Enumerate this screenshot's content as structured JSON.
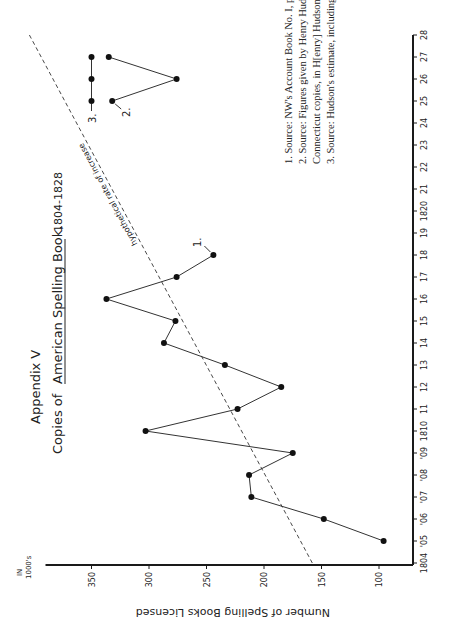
{
  "chart_data": {
    "type": "line",
    "title_line1": "Appendix V",
    "title_prefix": "Copies of",
    "title_book": "American Spelling Book,",
    "title_range": "1804-1828",
    "ylabel": "Number of Spelling Books Licensed",
    "yunits": [
      "IN",
      "1000's"
    ],
    "xlabel": "",
    "xlim": [
      1804,
      1828
    ],
    "ylim": [
      78,
      390
    ],
    "x_ticks": [
      {
        "value": 1804,
        "label": "1804"
      },
      {
        "value": 1805,
        "label": "'05"
      },
      {
        "value": 1806,
        "label": "'06"
      },
      {
        "value": 1807,
        "label": "'07"
      },
      {
        "value": 1808,
        "label": "'08"
      },
      {
        "value": 1809,
        "label": "'09"
      },
      {
        "value": 1810,
        "label": "1810"
      },
      {
        "value": 1811,
        "label": "11"
      },
      {
        "value": 1812,
        "label": "12"
      },
      {
        "value": 1813,
        "label": "13"
      },
      {
        "value": 1814,
        "label": "14"
      },
      {
        "value": 1815,
        "label": "15"
      },
      {
        "value": 1816,
        "label": "16"
      },
      {
        "value": 1817,
        "label": "17"
      },
      {
        "value": 1818,
        "label": "18"
      },
      {
        "value": 1819,
        "label": "19"
      },
      {
        "value": 1820,
        "label": "1820"
      },
      {
        "value": 1821,
        "label": "21"
      },
      {
        "value": 1822,
        "label": "22"
      },
      {
        "value": 1823,
        "label": "23"
      },
      {
        "value": 1824,
        "label": "24"
      },
      {
        "value": 1825,
        "label": "25"
      },
      {
        "value": 1826,
        "label": "26"
      },
      {
        "value": 1827,
        "label": "27"
      },
      {
        "value": 1828,
        "label": "28"
      }
    ],
    "y_ticks": [
      100,
      150,
      200,
      250,
      300,
      350
    ],
    "series": [
      {
        "name": "1.",
        "note": "NW's Account Book",
        "x": [
          1805,
          1806,
          1807,
          1808,
          1809,
          1810,
          1811,
          1812,
          1813,
          1814,
          1815,
          1816,
          1817,
          1818
        ],
        "values": [
          96,
          148,
          211,
          213,
          175,
          303,
          223,
          185,
          234,
          287,
          277,
          337,
          276,
          244
        ]
      },
      {
        "name": "2.",
        "note": "Henry Hudson figures",
        "x": [
          1825,
          1826,
          1827
        ],
        "values": [
          332,
          276,
          335
        ]
      },
      {
        "name": "3.",
        "note": "Hudson's estimate",
        "x": [
          1825,
          1826,
          1827
        ],
        "values": [
          350,
          350,
          350
        ]
      }
    ],
    "trend": {
      "label": "hypothetical rate of increase",
      "x": [
        1804,
        1828
      ],
      "values": [
        158,
        404
      ]
    },
    "footnotes": [
      "1.  Source: NW's Account Book No. I, pp. 63–68, NN–Account Books.",
      "2.  Source: Figures given by Henry Hudson to Noah Webster, excluding",
      "     Connecticut copies, in H[enry] Hudson to NW, September 11, 1828, NN–5.",
      "3.  Source: Hudson's estimate, including his own Connecticut copies (ibid.)."
    ],
    "grid": false,
    "legend": "none"
  }
}
